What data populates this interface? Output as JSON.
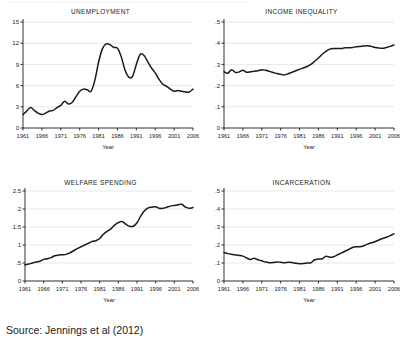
{
  "figure": {
    "source_note": "Source: Jennings et al (2012)",
    "axis_color": "#1a1a1a",
    "line_color": "#1a1a1a",
    "grid_color": "#d8dde3"
  },
  "chart_data": [
    {
      "type": "line",
      "title": "UNEMPLOYMENT",
      "xlabel": "Year",
      "ylabel": "",
      "grid": true,
      "legend": "none",
      "xlim": [
        1961,
        2006
      ],
      "ylim": [
        0,
        15
      ],
      "xticks": [
        1961,
        1966,
        1971,
        1976,
        1981,
        1986,
        1991,
        1996,
        2001,
        2006
      ],
      "yticks": [
        "0",
        "3",
        "6",
        "9",
        "12",
        "15"
      ],
      "x": [
        1961,
        1962,
        1963,
        1964,
        1965,
        1966,
        1967,
        1968,
        1969,
        1970,
        1971,
        1972,
        1973,
        1974,
        1975,
        1976,
        1977,
        1978,
        1979,
        1980,
        1981,
        1982,
        1983,
        1984,
        1985,
        1986,
        1987,
        1988,
        1989,
        1990,
        1991,
        1992,
        1993,
        1994,
        1995,
        1996,
        1997,
        1998,
        1999,
        2000,
        2001,
        2002,
        2003,
        2004,
        2005,
        2006
      ],
      "values": [
        1.9,
        2.4,
        2.9,
        2.5,
        2.1,
        1.9,
        2.1,
        2.4,
        2.5,
        2.9,
        3.2,
        3.8,
        3.4,
        3.6,
        4.4,
        5.2,
        5.5,
        5.4,
        5.2,
        6.7,
        9.3,
        11.2,
        11.9,
        11.8,
        11.4,
        11.3,
        10.1,
        8.2,
        7.2,
        7.3,
        9.0,
        10.4,
        10.3,
        9.4,
        8.5,
        7.8,
        6.9,
        6.2,
        5.9,
        5.5,
        5.2,
        5.3,
        5.2,
        5.1,
        5.1,
        5.5
      ]
    },
    {
      "type": "line",
      "title": "INCOME INEQUALITY",
      "xlabel": "Year",
      "ylabel": "",
      "grid": true,
      "legend": "none",
      "xlim": [
        1961,
        2006
      ],
      "ylim": [
        0,
        0.5
      ],
      "xticks": [
        1961,
        1966,
        1971,
        1976,
        1981,
        1986,
        1991,
        1996,
        2001,
        2006
      ],
      "yticks": [
        "0",
        ".1",
        ".2",
        ".3",
        ".4",
        ".5"
      ],
      "x": [
        1961,
        1962,
        1963,
        1964,
        1965,
        1966,
        1967,
        1968,
        1969,
        1970,
        1971,
        1972,
        1973,
        1974,
        1975,
        1976,
        1977,
        1978,
        1979,
        1980,
        1981,
        1982,
        1983,
        1984,
        1985,
        1986,
        1987,
        1988,
        1989,
        1990,
        1991,
        1992,
        1993,
        1994,
        1995,
        1996,
        1997,
        1998,
        1999,
        2000,
        2001,
        2002,
        2003,
        2004,
        2005,
        2006
      ],
      "values": [
        0.265,
        0.258,
        0.275,
        0.262,
        0.264,
        0.272,
        0.263,
        0.265,
        0.268,
        0.27,
        0.275,
        0.272,
        0.267,
        0.262,
        0.257,
        0.253,
        0.25,
        0.256,
        0.263,
        0.27,
        0.277,
        0.283,
        0.29,
        0.3,
        0.315,
        0.33,
        0.348,
        0.362,
        0.372,
        0.375,
        0.375,
        0.375,
        0.378,
        0.378,
        0.38,
        0.383,
        0.385,
        0.387,
        0.388,
        0.385,
        0.38,
        0.377,
        0.376,
        0.38,
        0.385,
        0.392
      ]
    },
    {
      "type": "line",
      "title": "WELFARE SPENDING",
      "xlabel": "Year",
      "ylabel": "",
      "grid": true,
      "legend": "none",
      "xlim": [
        1961,
        2006
      ],
      "ylim": [
        0,
        2.5
      ],
      "xticks": [
        1961,
        1966,
        1971,
        1976,
        1981,
        1986,
        1991,
        1996,
        2001,
        2006
      ],
      "yticks": [
        "0",
        ".5",
        "1",
        "1.5",
        "2",
        "2.5"
      ],
      "x": [
        1961,
        1962,
        1963,
        1964,
        1965,
        1966,
        1967,
        1968,
        1969,
        1970,
        1971,
        1972,
        1973,
        1974,
        1975,
        1976,
        1977,
        1978,
        1979,
        1980,
        1981,
        1982,
        1983,
        1984,
        1985,
        1986,
        1987,
        1988,
        1989,
        1990,
        1991,
        1992,
        1993,
        1994,
        1995,
        1996,
        1997,
        1998,
        1999,
        2000,
        2001,
        2002,
        2003,
        2004,
        2005,
        2006
      ],
      "values": [
        0.45,
        0.47,
        0.5,
        0.53,
        0.55,
        0.6,
        0.62,
        0.65,
        0.7,
        0.72,
        0.73,
        0.74,
        0.78,
        0.84,
        0.9,
        0.95,
        1.0,
        1.05,
        1.1,
        1.12,
        1.18,
        1.3,
        1.38,
        1.45,
        1.55,
        1.62,
        1.65,
        1.58,
        1.52,
        1.52,
        1.62,
        1.8,
        1.95,
        2.03,
        2.05,
        2.06,
        2.02,
        2.02,
        2.05,
        2.08,
        2.1,
        2.12,
        2.13,
        2.05,
        2.02,
        2.04
      ]
    },
    {
      "type": "line",
      "title": "INCARCERATION",
      "xlabel": "Year",
      "ylabel": "",
      "grid": true,
      "legend": "none",
      "xlim": [
        1961,
        2006
      ],
      "ylim": [
        0,
        0.5
      ],
      "xticks": [
        1961,
        1966,
        1971,
        1976,
        1981,
        1986,
        1991,
        1996,
        2001,
        2006
      ],
      "yticks": [
        "0",
        ".1",
        ".2",
        ".3",
        ".4",
        ".5"
      ],
      "x": [
        1961,
        1962,
        1963,
        1964,
        1965,
        1966,
        1967,
        1968,
        1969,
        1970,
        1971,
        1972,
        1973,
        1974,
        1975,
        1976,
        1977,
        1978,
        1979,
        1980,
        1981,
        1982,
        1983,
        1984,
        1985,
        1986,
        1987,
        1988,
        1989,
        1990,
        1991,
        1992,
        1993,
        1994,
        1995,
        1996,
        1997,
        1998,
        1999,
        2000,
        2001,
        2002,
        2003,
        2004,
        2005,
        2006
      ],
      "values": [
        0.158,
        0.152,
        0.148,
        0.145,
        0.142,
        0.138,
        0.128,
        0.12,
        0.126,
        0.118,
        0.112,
        0.105,
        0.102,
        0.103,
        0.106,
        0.104,
        0.102,
        0.104,
        0.103,
        0.098,
        0.096,
        0.097,
        0.1,
        0.101,
        0.118,
        0.122,
        0.124,
        0.138,
        0.132,
        0.135,
        0.145,
        0.155,
        0.165,
        0.175,
        0.186,
        0.19,
        0.19,
        0.196,
        0.205,
        0.212,
        0.218,
        0.228,
        0.236,
        0.243,
        0.252,
        0.262
      ]
    }
  ]
}
